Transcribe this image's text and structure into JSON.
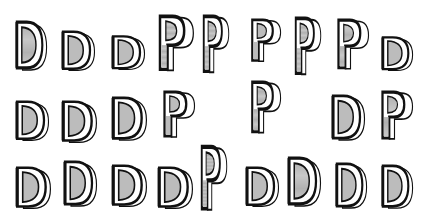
{
  "figure": {
    "colors": {
      "ink": "#111111",
      "shade": "#c8c8c8",
      "paper": "#ffffff"
    },
    "rows": [
      {
        "row": 1,
        "glyphs": [
          {
            "x": 14,
            "y": 20,
            "w": 34,
            "h": 52,
            "form": "D-hooked"
          },
          {
            "x": 60,
            "y": 30,
            "w": 36,
            "h": 42,
            "form": "D-block"
          },
          {
            "x": 110,
            "y": 35,
            "w": 36,
            "h": 36,
            "form": "D-small"
          },
          {
            "x": 155,
            "y": 14,
            "w": 40,
            "h": 60,
            "form": "P-scroll"
          },
          {
            "x": 200,
            "y": 14,
            "w": 30,
            "h": 62,
            "form": "P-stacked"
          },
          {
            "x": 248,
            "y": 18,
            "w": 34,
            "h": 46,
            "form": "P-shaded"
          },
          {
            "x": 292,
            "y": 16,
            "w": 30,
            "h": 62,
            "form": "R-scroll"
          },
          {
            "x": 334,
            "y": 18,
            "w": 36,
            "h": 54,
            "form": "P-scroll-round"
          },
          {
            "x": 380,
            "y": 36,
            "w": 34,
            "h": 36,
            "form": "D-hooked-small"
          }
        ]
      },
      {
        "row": 2,
        "glyphs": [
          {
            "x": 14,
            "y": 100,
            "w": 36,
            "h": 42,
            "form": "D-crossed"
          },
          {
            "x": 60,
            "y": 100,
            "w": 38,
            "h": 44,
            "form": "D-outline"
          },
          {
            "x": 110,
            "y": 96,
            "w": 38,
            "h": 46,
            "form": "D-flame"
          },
          {
            "x": 160,
            "y": 90,
            "w": 36,
            "h": 50,
            "form": "P-layered"
          },
          {
            "x": 248,
            "y": 80,
            "w": 34,
            "h": 56,
            "form": "P-bent"
          },
          {
            "x": 330,
            "y": 94,
            "w": 36,
            "h": 48,
            "form": "D-cap"
          },
          {
            "x": 378,
            "y": 90,
            "w": 36,
            "h": 52,
            "form": "P-serrated"
          }
        ]
      },
      {
        "row": 3,
        "glyphs": [
          {
            "x": 14,
            "y": 166,
            "w": 38,
            "h": 44,
            "form": "D-curl"
          },
          {
            "x": 62,
            "y": 160,
            "w": 36,
            "h": 48,
            "form": "D-ribbed"
          },
          {
            "x": 110,
            "y": 164,
            "w": 38,
            "h": 44,
            "form": "D-harp"
          },
          {
            "x": 156,
            "y": 166,
            "w": 38,
            "h": 44,
            "form": "D-fold"
          },
          {
            "x": 198,
            "y": 144,
            "w": 30,
            "h": 70,
            "form": "P-tall"
          },
          {
            "x": 244,
            "y": 166,
            "w": 36,
            "h": 42,
            "form": "D-slant"
          },
          {
            "x": 286,
            "y": 156,
            "w": 36,
            "h": 52,
            "form": "D-scroll-top"
          },
          {
            "x": 334,
            "y": 162,
            "w": 34,
            "h": 48,
            "form": "D-base"
          },
          {
            "x": 380,
            "y": 164,
            "w": 34,
            "h": 46,
            "form": "D-cube"
          }
        ]
      }
    ]
  }
}
